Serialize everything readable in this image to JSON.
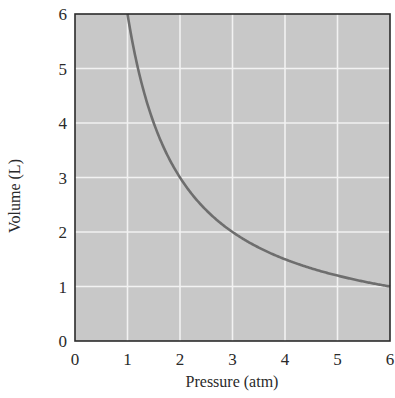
{
  "chart_data": {
    "type": "line",
    "title": "",
    "xlabel": "Pressure (atm)",
    "ylabel": "Volume (L)",
    "xlim": [
      0,
      6
    ],
    "ylim": [
      0,
      6
    ],
    "x_ticks": [
      "0",
      "1",
      "2",
      "3",
      "4",
      "5",
      "6"
    ],
    "y_ticks": [
      "0",
      "1",
      "2",
      "3",
      "4",
      "5",
      "6"
    ],
    "grid": true,
    "legend": null,
    "series": [
      {
        "name": "V = 6/P",
        "x": [
          1,
          1.25,
          1.5,
          2,
          2.5,
          3,
          3.5,
          4,
          4.5,
          5,
          5.5,
          6
        ],
        "y": [
          6,
          4.8,
          4,
          3,
          2.4,
          2,
          1.71,
          1.5,
          1.33,
          1.2,
          1.09,
          1
        ],
        "color": "#6e6e6e"
      }
    ],
    "colors": {
      "plot_background": "#c8c8c8",
      "grid": "#f2f2f2",
      "frame": "#2b2b2b"
    }
  }
}
